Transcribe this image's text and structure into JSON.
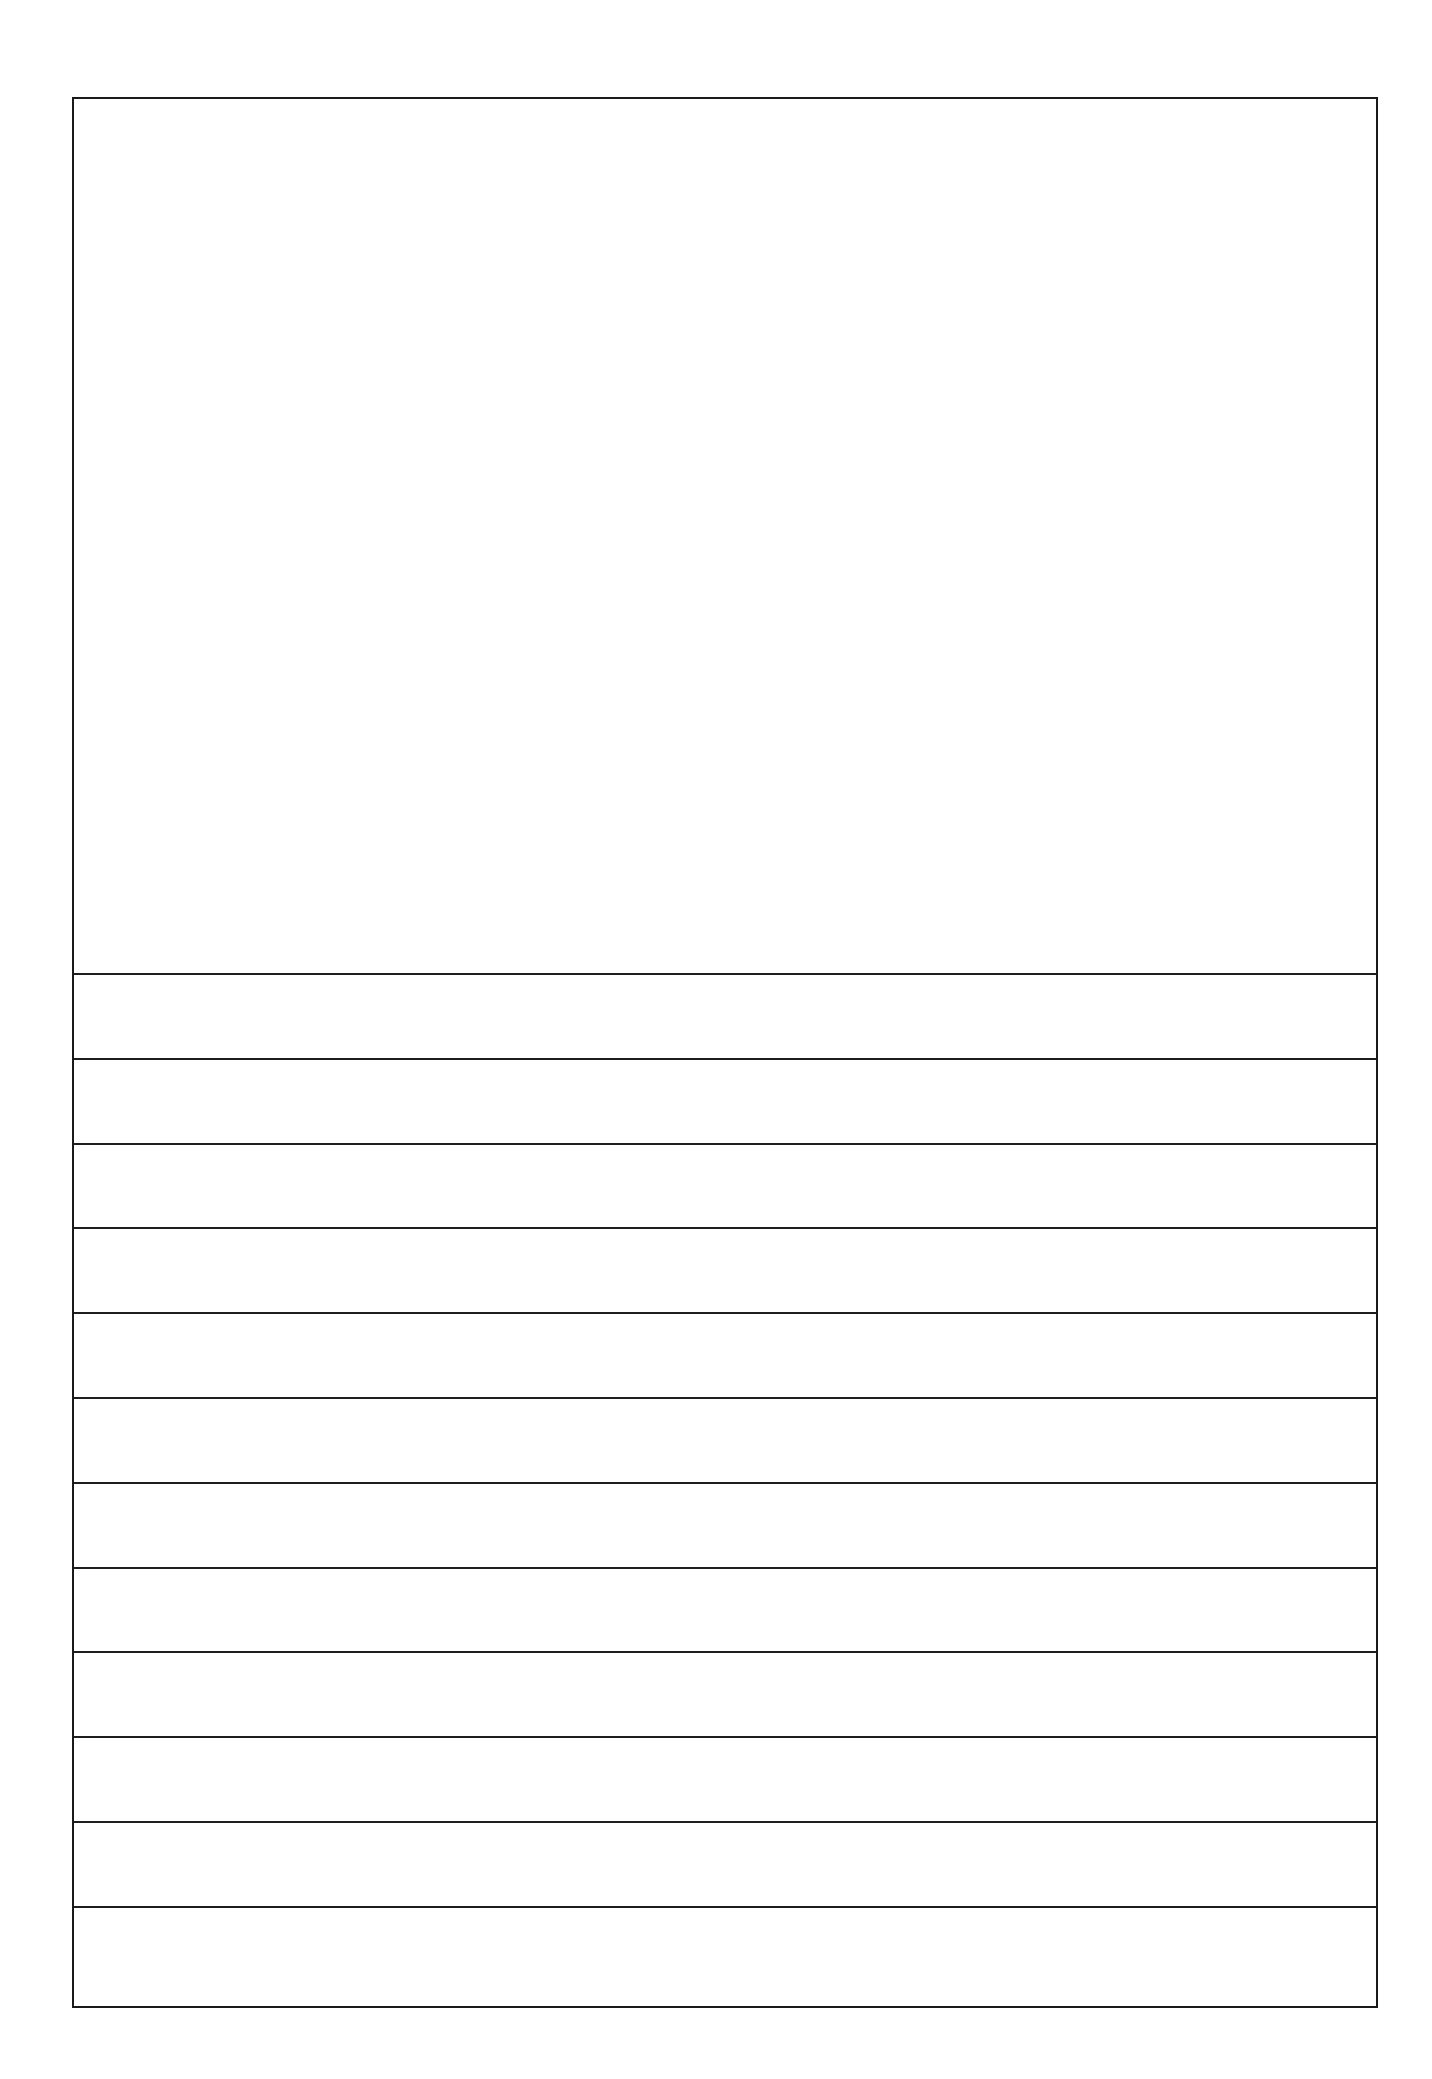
{
  "template": {
    "type": "draw-and-write",
    "drawing_area": {
      "label": "",
      "content": ""
    },
    "writing_lines": [
      {
        "index": 1,
        "text": ""
      },
      {
        "index": 2,
        "text": ""
      },
      {
        "index": 3,
        "text": ""
      },
      {
        "index": 4,
        "text": ""
      },
      {
        "index": 5,
        "text": ""
      },
      {
        "index": 6,
        "text": ""
      },
      {
        "index": 7,
        "text": ""
      },
      {
        "index": 8,
        "text": ""
      },
      {
        "index": 9,
        "text": ""
      },
      {
        "index": 10,
        "text": ""
      },
      {
        "index": 11,
        "text": ""
      },
      {
        "index": 12,
        "text": ""
      }
    ],
    "colors": {
      "line": "#1e1e1e",
      "border": "#1a1a1a",
      "background": "#ffffff"
    }
  }
}
